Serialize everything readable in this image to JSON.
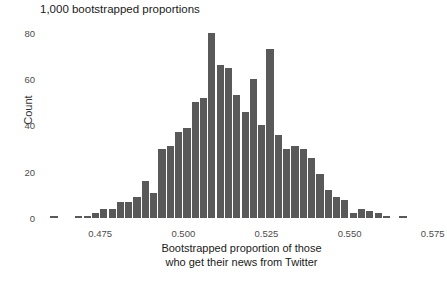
{
  "chart_data": {
    "type": "bar",
    "title": "1,000 bootstrapped proportions",
    "subtitle": "",
    "xlabel_line1": "Bootstrapped proportion of those",
    "xlabel_line2": "who get their news from Twitter",
    "ylabel": "Count",
    "grid": false,
    "legend": "none",
    "xlim": [
      0.4575,
      0.5775
    ],
    "ylim": [
      0,
      83
    ],
    "bin_width": 0.0025,
    "x_ticks": [
      0.475,
      0.5,
      0.525,
      0.55,
      0.575
    ],
    "x_tick_labels": [
      "0.475",
      "0.500",
      "0.525",
      "0.550",
      "0.575"
    ],
    "y_ticks": [
      0,
      20,
      40,
      60,
      80
    ],
    "y_tick_labels": [
      "0",
      "20",
      "40",
      "60",
      "80"
    ],
    "bar_color": "#595959",
    "background_color": "#ffffff",
    "categories": [
      0.46,
      0.4675,
      0.47,
      0.4725,
      0.475,
      0.4775,
      0.48,
      0.4825,
      0.485,
      0.4875,
      0.49,
      0.4925,
      0.495,
      0.4975,
      0.5,
      0.5025,
      0.505,
      0.5075,
      0.51,
      0.5125,
      0.515,
      0.5175,
      0.52,
      0.5225,
      0.525,
      0.5275,
      0.53,
      0.5325,
      0.535,
      0.5375,
      0.54,
      0.5425,
      0.545,
      0.5475,
      0.55,
      0.5525,
      0.555,
      0.5575,
      0.56,
      0.5625,
      0.565,
      0.5675,
      0.57,
      0.5725
    ],
    "values": [
      1,
      1,
      1,
      2,
      4,
      4,
      7,
      7,
      9,
      16,
      11,
      30,
      31,
      37,
      39,
      50,
      52,
      80,
      66,
      65,
      53,
      46,
      60,
      40,
      73,
      36,
      30,
      31,
      30,
      26,
      19,
      12,
      9,
      8,
      2,
      4,
      3,
      2,
      1,
      1,
      1,
      1,
      0,
      0
    ],
    "bars": [
      {
        "x": 0.46,
        "count": 1
      },
      {
        "x": 0.4675,
        "count": 1
      },
      {
        "x": 0.47,
        "count": 1
      },
      {
        "x": 0.4725,
        "count": 2
      },
      {
        "x": 0.475,
        "count": 4
      },
      {
        "x": 0.4775,
        "count": 4
      },
      {
        "x": 0.48,
        "count": 7
      },
      {
        "x": 0.4825,
        "count": 7
      },
      {
        "x": 0.485,
        "count": 9
      },
      {
        "x": 0.4875,
        "count": 16
      },
      {
        "x": 0.49,
        "count": 11
      },
      {
        "x": 0.4925,
        "count": 30
      },
      {
        "x": 0.495,
        "count": 31
      },
      {
        "x": 0.4975,
        "count": 37
      },
      {
        "x": 0.5,
        "count": 39
      },
      {
        "x": 0.5025,
        "count": 50
      },
      {
        "x": 0.505,
        "count": 52
      },
      {
        "x": 0.5075,
        "count": 80
      },
      {
        "x": 0.51,
        "count": 66
      },
      {
        "x": 0.5125,
        "count": 65
      },
      {
        "x": 0.515,
        "count": 53
      },
      {
        "x": 0.5175,
        "count": 46
      },
      {
        "x": 0.52,
        "count": 60
      },
      {
        "x": 0.5225,
        "count": 40
      },
      {
        "x": 0.525,
        "count": 73
      },
      {
        "x": 0.5275,
        "count": 36
      },
      {
        "x": 0.53,
        "count": 30
      },
      {
        "x": 0.5325,
        "count": 31
      },
      {
        "x": 0.535,
        "count": 30
      },
      {
        "x": 0.5375,
        "count": 26
      },
      {
        "x": 0.54,
        "count": 19
      },
      {
        "x": 0.5425,
        "count": 12
      },
      {
        "x": 0.545,
        "count": 9
      },
      {
        "x": 0.5475,
        "count": 8
      },
      {
        "x": 0.55,
        "count": 2
      },
      {
        "x": 0.5525,
        "count": 4
      },
      {
        "x": 0.555,
        "count": 3
      },
      {
        "x": 0.5575,
        "count": 2
      },
      {
        "x": 0.56,
        "count": 1
      },
      {
        "x": 0.565,
        "count": 1
      }
    ]
  }
}
